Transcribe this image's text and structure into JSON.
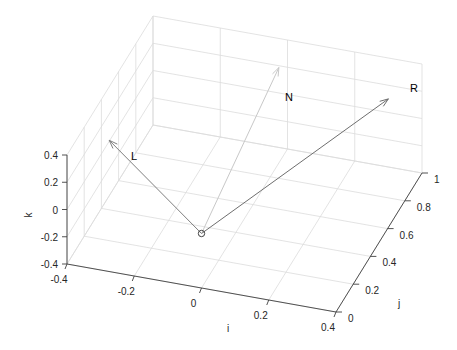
{
  "chart_data": {
    "type": "quiver3d",
    "title": "",
    "xlabel": "i",
    "ylabel": "j",
    "zlabel": "k",
    "xlim": [
      -0.4,
      0.4
    ],
    "ylim": [
      0,
      1
    ],
    "zlim": [
      -0.4,
      0.4
    ],
    "xticks": [
      "-0.4",
      "-0.2",
      "0",
      "0.2",
      "0.4"
    ],
    "yticks": [
      "0",
      "0.2",
      "0.4",
      "0.6",
      "0.8",
      "1"
    ],
    "zticks": [
      "-0.4",
      "-0.2",
      "0",
      "0.2",
      "0.4"
    ],
    "grid": true,
    "origin_marker": {
      "i": 0,
      "j": 0,
      "k": 0,
      "symbol": "circle"
    },
    "vectors": [
      {
        "name": "L",
        "origin": [
          0,
          0,
          0
        ],
        "tip": [
          -0.3,
          0.1,
          0.45
        ],
        "color": "#7f7f7f"
      },
      {
        "name": "N",
        "origin": [
          0,
          0,
          0
        ],
        "tip": [
          0.0,
          0.9,
          0.3
        ],
        "color": "#c8c8c8"
      },
      {
        "name": "R",
        "origin": [
          0,
          0,
          0
        ],
        "tip": [
          0.3,
          1.0,
          0.1
        ],
        "color": "#6e6e6e"
      }
    ]
  },
  "labels": {
    "x": "i",
    "y": "j",
    "z": "k",
    "L": "L",
    "N": "N",
    "R": "R"
  },
  "ticks": {
    "x": [
      "-0.4",
      "-0.2",
      "0",
      "0.2",
      "0.4"
    ],
    "y": [
      "0",
      "0.2",
      "0.4",
      "0.6",
      "0.8",
      "1"
    ],
    "z": [
      "-0.4",
      "-0.2",
      "0",
      "0.2",
      "0.4"
    ]
  }
}
